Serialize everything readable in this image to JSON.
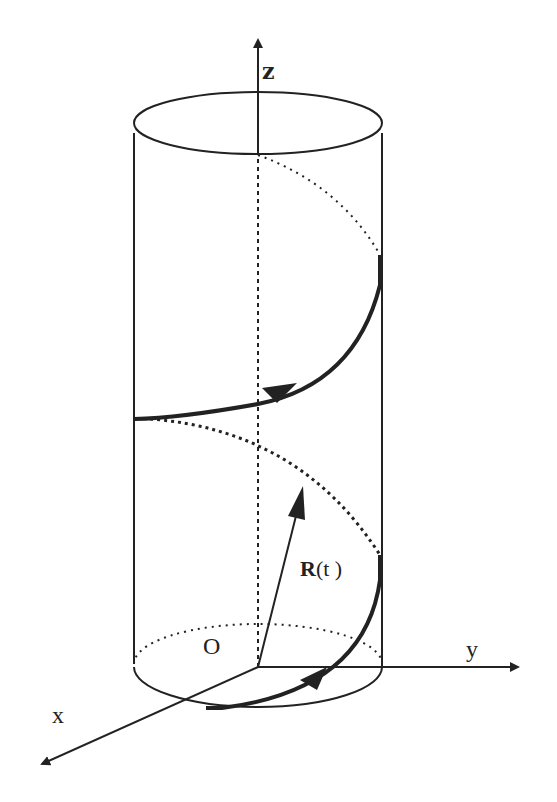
{
  "figure": {
    "type": "helix-on-cylinder",
    "colors": {
      "ink": "#222222",
      "background": "#ffffff"
    },
    "labels": {
      "z_axis": "z",
      "y_axis": "y",
      "x_axis": "x",
      "origin": "O",
      "vector_bold": "R",
      "vector_arg": "(t )"
    },
    "elements": [
      "cylinder-top-ellipse",
      "cylinder-side-lines",
      "cylinder-base-ellipse",
      "z-axis",
      "y-axis",
      "x-axis",
      "position-vector-R",
      "helix-curve-front",
      "helix-curve-back-dotted"
    ]
  }
}
